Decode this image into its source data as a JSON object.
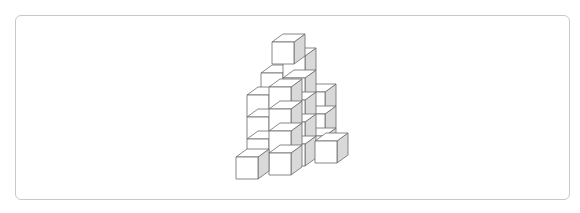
{
  "figure": {
    "cube_size": 22,
    "depth_dx": 11,
    "depth_dy": -8,
    "colors": {
      "front": "#ffffff",
      "top": "#ffffff",
      "side": "#d9d9d9",
      "edge": "#6b6b6b",
      "frame": "#c8c8c8"
    },
    "cubes": [
      {
        "x": 303,
        "y": 92
      },
      {
        "x": 303,
        "y": 114
      },
      {
        "x": 303,
        "y": 136
      },
      {
        "x": 261,
        "y": 73
      },
      {
        "x": 283,
        "y": 56
      },
      {
        "x": 283,
        "y": 78
      },
      {
        "x": 283,
        "y": 100
      },
      {
        "x": 283,
        "y": 122
      },
      {
        "x": 283,
        "y": 144
      },
      {
        "x": 272,
        "y": 42
      },
      {
        "x": 247,
        "y": 95
      },
      {
        "x": 247,
        "y": 117
      },
      {
        "x": 247,
        "y": 139
      },
      {
        "x": 315,
        "y": 141
      },
      {
        "x": 269,
        "y": 87
      },
      {
        "x": 269,
        "y": 109
      },
      {
        "x": 269,
        "y": 131
      },
      {
        "x": 269,
        "y": 153
      },
      {
        "x": 236,
        "y": 157
      }
    ]
  }
}
